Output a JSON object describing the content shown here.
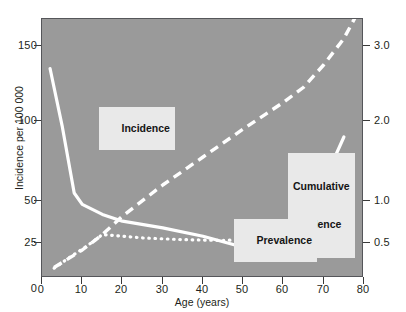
{
  "chart_data": {
    "type": "line",
    "title": "",
    "xlabel": "Age (years)",
    "ylabel": "Incidence per 100 000",
    "ylabel_right": "Prevalence / cumulative incidence (%)",
    "xlim": [
      0,
      80
    ],
    "x_ticks": [
      0,
      10,
      20,
      30,
      40,
      50,
      60,
      70,
      80
    ],
    "x_tick_labels": [
      "0",
      "10",
      "20",
      "30",
      "40",
      "50",
      "60",
      "70",
      "80"
    ],
    "y_left_ticks": [
      0,
      25,
      50,
      100,
      150
    ],
    "y_left_tick_labels": [
      "0",
      "25",
      "50",
      "100",
      "150"
    ],
    "y_left_note": "non-linear axis: 0,25,50 evenly spaced then 100,150",
    "y_right_ticks": [
      0.5,
      1.0,
      2.0,
      3.0
    ],
    "y_right_tick_labels": [
      "0.5",
      "1.0",
      "2.0",
      "3.0"
    ],
    "grid": false,
    "legend": "inline-callouts",
    "plot_background": "#9a9a9a",
    "series_color": "#ffffff",
    "series": [
      {
        "name": "Incidence",
        "label": "Incidence",
        "axis": "left",
        "style": "solid",
        "units": "per 100 000",
        "points": [
          {
            "x": 2,
            "y": 135
          },
          {
            "x": 5,
            "y": 97
          },
          {
            "x": 8,
            "y": 55
          },
          {
            "x": 10,
            "y": 48
          },
          {
            "x": 15,
            "y": 42
          },
          {
            "x": 20,
            "y": 38
          },
          {
            "x": 30,
            "y": 34
          },
          {
            "x": 40,
            "y": 29
          },
          {
            "x": 50,
            "y": 22
          },
          {
            "x": 58,
            "y": 30
          },
          {
            "x": 65,
            "y": 40
          },
          {
            "x": 70,
            "y": 62
          },
          {
            "x": 75,
            "y": 90
          }
        ]
      },
      {
        "name": "Cumulative incidence",
        "label": "Cumulative\nincidence",
        "axis": "right",
        "style": "dashed",
        "units": "%",
        "points": [
          {
            "x": 3,
            "y": 0.15
          },
          {
            "x": 10,
            "y": 0.4
          },
          {
            "x": 15,
            "y": 0.6
          },
          {
            "x": 20,
            "y": 0.82
          },
          {
            "x": 30,
            "y": 1.2
          },
          {
            "x": 40,
            "y": 1.55
          },
          {
            "x": 50,
            "y": 1.9
          },
          {
            "x": 60,
            "y": 2.25
          },
          {
            "x": 65,
            "y": 2.45
          },
          {
            "x": 70,
            "y": 2.75
          },
          {
            "x": 75,
            "y": 3.1
          },
          {
            "x": 78,
            "y": 3.4
          }
        ]
      },
      {
        "name": "Prevalence",
        "label": "Prevalence",
        "axis": "right",
        "style": "dotted",
        "units": "%",
        "points": [
          {
            "x": 3,
            "y": 0.14
          },
          {
            "x": 7,
            "y": 0.3
          },
          {
            "x": 11,
            "y": 0.45
          },
          {
            "x": 15,
            "y": 0.6
          },
          {
            "x": 25,
            "y": 0.56
          },
          {
            "x": 35,
            "y": 0.54
          },
          {
            "x": 45,
            "y": 0.53
          },
          {
            "x": 55,
            "y": 0.55
          },
          {
            "x": 60,
            "y": 0.6
          },
          {
            "x": 65,
            "y": 0.68
          },
          {
            "x": 70,
            "y": 0.8
          },
          {
            "x": 75,
            "y": 0.92
          }
        ]
      }
    ]
  },
  "axes": {
    "x_label": "Age (years)",
    "y_left_label": "Incidence per 100 000",
    "y_right_label": "Prevalence / cumulative incidence (%)",
    "x_ticks": [
      "0",
      "10",
      "20",
      "30",
      "40",
      "50",
      "60",
      "70",
      "80"
    ],
    "y_left_ticks": [
      "150",
      "100",
      "50",
      "25",
      "0"
    ],
    "y_right_ticks": [
      "3.0",
      "2.0",
      "1.0",
      "0.5"
    ]
  },
  "callouts": {
    "incidence": "Incidence",
    "cumulative_line1": "Cumulative",
    "cumulative_line2": "incidence",
    "prevalence": "Prevalence"
  }
}
